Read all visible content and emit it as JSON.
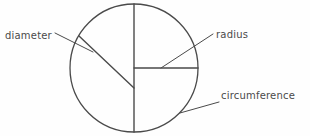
{
  "figure": {
    "kind": "geometry-diagram",
    "background_color": "#fefefe",
    "stroke_color": "#4a4a4a",
    "text_color": "#4a4a4a"
  },
  "labels": {
    "diameter": "diameter",
    "radius": "radius",
    "circumference": "circumference"
  },
  "geometry": {
    "circle": {
      "cx": 134,
      "cy": 68,
      "r": 64
    },
    "vertical_diameter": {
      "x1": 134,
      "y1": 4,
      "x2": 134,
      "y2": 132
    },
    "horizontal_radius": {
      "x1": 134,
      "y1": 68,
      "x2": 198,
      "y2": 68
    },
    "diagonal_chord": {
      "x1": 79,
      "y1": 36,
      "x2": 134,
      "y2": 88
    },
    "leader_diameter": {
      "x1": 55,
      "y1": 33,
      "x2": 93,
      "y2": 52
    },
    "leader_radius": {
      "x1": 213,
      "y1": 34,
      "x2": 161,
      "y2": 68
    },
    "leader_circumference": {
      "x1": 219,
      "y1": 102,
      "x2": 180,
      "y2": 113
    }
  }
}
